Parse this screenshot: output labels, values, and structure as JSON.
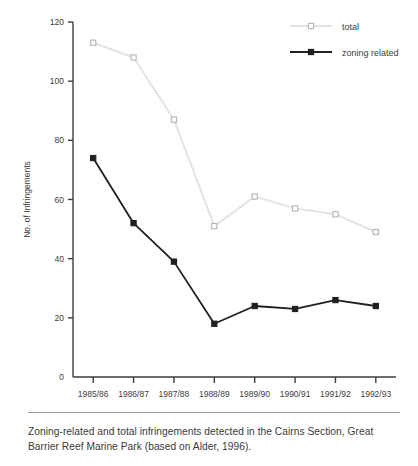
{
  "figure": {
    "caption": "Zoning-related and total infringements detected in the Cairns Section, Great Barrier Reef Marine Park (based on Alder, 1996)."
  },
  "colors": {
    "total_line": "#e3e3e3",
    "total_marker_stroke": "#b4b4b4",
    "zoning_line": "#231f20",
    "zoning_marker": "#231f20",
    "axis": "#3d3d3d",
    "text": "#3d3d3d",
    "rule": "#9a9a9a",
    "background": "#ffffff"
  },
  "chart_data": {
    "type": "line",
    "title": "",
    "xlabel": "Year",
    "ylabel": "No. of Infringements",
    "categories": [
      "1985/86",
      "1986/87",
      "1987/88",
      "1988/89",
      "1989/90",
      "1990/91",
      "1991/92",
      "1992/93"
    ],
    "series": [
      {
        "name": "total",
        "values": [
          113,
          108,
          87,
          51,
          61,
          57,
          55,
          49
        ],
        "color": "#e3e3e3",
        "marker": "open-square"
      },
      {
        "name": "zoning related",
        "values": [
          74,
          52,
          39,
          18,
          24,
          23,
          26,
          24
        ],
        "color": "#231f20",
        "marker": "filled-square"
      }
    ],
    "ylim": [
      0,
      120
    ],
    "yticks": [
      0,
      20,
      40,
      60,
      80,
      100,
      120
    ],
    "ytick_labels": [
      "0",
      "20",
      "40",
      "60",
      "80",
      "100",
      "120"
    ],
    "grid": false,
    "legend_position": "top-right",
    "legend_entries": [
      "total",
      "zoning related"
    ]
  }
}
